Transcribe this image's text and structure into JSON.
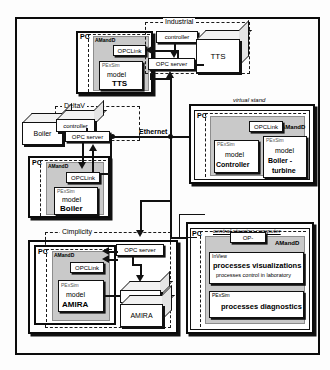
{
  "diagram": {
    "network_label": "Ethernet",
    "groups": {
      "industrial": "Industrial",
      "deltav": "DeltaV",
      "cimplicity": "Cimplicity",
      "virtual_stand": "virtual stand",
      "central_computer": "central steering computer"
    },
    "pc_label": "PC",
    "amandd_label": "AMandD",
    "pexsim_label": "PExSim",
    "opclink_label": "OPCLink",
    "opcserver_label": "OPC server",
    "controller_label": "controller",
    "stands": {
      "tts": {
        "pc": "PC",
        "amandd": "AMandD",
        "opclink": "OPCLink",
        "pexsim": "PExSim",
        "model_word": "model",
        "model_name": "TTS",
        "group": "Industrial",
        "controller": "controller",
        "opc_server": "OPC server",
        "plant": "TTS"
      },
      "boiler": {
        "group": "DeltaV",
        "plant": "Boiler",
        "controller": "controller",
        "opc_server": "OPC server",
        "pc": "PC",
        "amandd": "AMandD",
        "opclink": "OPCLink",
        "pexsim": "PExSim",
        "model_word": "model",
        "model_name": "Boiler"
      },
      "amira": {
        "group": "Cimplicity",
        "pc": "PC",
        "amandd": "AMandD",
        "opclink": "OPCLink",
        "pexsim": "PExSim",
        "model_word": "model",
        "model_name": "AMIRA",
        "opc_server": "OPC server",
        "controller": "controller",
        "plant": "AMIRA"
      },
      "virtual": {
        "group": "virtual stand",
        "pc": "PC",
        "amandd": "AMandD",
        "opclink": "OPCLink",
        "model_a": {
          "tool": "PExSim",
          "word": "model",
          "name": "Controller"
        },
        "model_b": {
          "tool": "PExSim",
          "word": "model",
          "name": "Boiler -",
          "name2": "turbine"
        }
      },
      "central": {
        "group": "central steering computer",
        "pc": "PC",
        "amandd": "AMandD",
        "op": "OP-",
        "inview": {
          "tool": "InView",
          "line1": "processes visualizations",
          "line2": "processes control in laboratory"
        },
        "pexsim": {
          "tool": "PExSim",
          "line1": "processes diagnostics"
        }
      }
    },
    "colors": {
      "line": "#111111",
      "amandd_fill": "#c9c9c9",
      "box_fill": "#ffffff",
      "page_bg": "#fdfdfd"
    }
  }
}
